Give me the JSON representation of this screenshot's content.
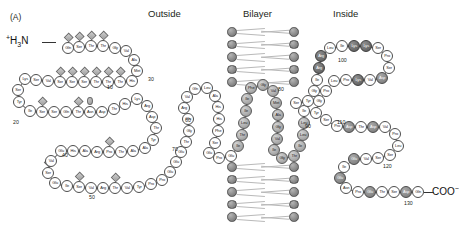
{
  "figure": {
    "panel_label": "(A)",
    "type": "membrane-protein-topology-diagram",
    "n_terminus": "H3N",
    "n_terminus_charge": "+",
    "c_terminus": "COO",
    "c_terminus_charge": "-"
  },
  "headers": [
    {
      "label": "Outside",
      "x": 148,
      "y": 8
    },
    {
      "label": "Bilayer",
      "x": 243,
      "y": 8
    },
    {
      "label": "Inside",
      "x": 333,
      "y": 8
    }
  ],
  "legend_markers": {
    "diamond": "o-linked-glycosylation-site",
    "oval": "n-linked-glycosylation-site",
    "light-circle": "extracellular-residue",
    "shaded-circle": "transmembrane-residue",
    "dark-circle": "charged-residue"
  },
  "number_labels": [
    {
      "text": "10",
      "x": 107,
      "y": 84
    },
    {
      "text": "20",
      "x": 13,
      "y": 119
    },
    {
      "text": "30",
      "x": 148,
      "y": 76
    },
    {
      "text": "40",
      "x": 62,
      "y": 152
    },
    {
      "text": "50",
      "x": 89,
      "y": 194
    },
    {
      "text": "60",
      "x": 185,
      "y": 117
    },
    {
      "text": "70",
      "x": 172,
      "y": 146
    },
    {
      "text": "80",
      "x": 278,
      "y": 86
    },
    {
      "text": "90",
      "x": 305,
      "y": 123
    },
    {
      "text": "100",
      "x": 338,
      "y": 57
    },
    {
      "text": "110",
      "x": 337,
      "y": 119
    },
    {
      "text": "120",
      "x": 383,
      "y": 163
    },
    {
      "text": "130",
      "x": 404,
      "y": 200
    }
  ],
  "residues": [
    {
      "n": 1,
      "aa": "Gln",
      "x": 62,
      "y": 42,
      "c": "p",
      "mark": "dia"
    },
    {
      "n": 2,
      "aa": "Ser",
      "x": 73,
      "y": 41,
      "c": "p",
      "mark": "dia"
    },
    {
      "n": 3,
      "aa": "Thr",
      "x": 85,
      "y": 40,
      "c": "p",
      "mark": "dia"
    },
    {
      "n": 4,
      "aa": "Thr",
      "x": 97,
      "y": 40,
      "c": "p",
      "mark": "dia"
    },
    {
      "n": 5,
      "aa": "Gly",
      "x": 109,
      "y": 42,
      "c": "p"
    },
    {
      "n": 6,
      "aa": "Val",
      "x": 120,
      "y": 45,
      "c": "p"
    },
    {
      "n": 7,
      "aa": "Ala",
      "x": 128,
      "y": 54,
      "c": "p"
    },
    {
      "n": 8,
      "aa": "Met",
      "x": 131,
      "y": 65,
      "c": "p"
    },
    {
      "n": 9,
      "aa": "His",
      "x": 126,
      "y": 75,
      "c": "p"
    },
    {
      "n": 10,
      "aa": "Thr",
      "x": 114,
      "y": 76,
      "c": "p",
      "mark": "dia"
    },
    {
      "n": 11,
      "aa": "Thr",
      "x": 102,
      "y": 76,
      "c": "p",
      "mark": "dia"
    },
    {
      "n": 12,
      "aa": "Thr",
      "x": 90,
      "y": 76,
      "c": "p",
      "mark": "dia"
    },
    {
      "n": 13,
      "aa": "Ser",
      "x": 78,
      "y": 76,
      "c": "p",
      "mark": "dia"
    },
    {
      "n": 14,
      "aa": "Ser",
      "x": 66,
      "y": 76,
      "c": "p",
      "mark": "dia"
    },
    {
      "n": 15,
      "aa": "Ser",
      "x": 54,
      "y": 76,
      "c": "p",
      "mark": "dia"
    },
    {
      "n": 16,
      "aa": "Val",
      "x": 42,
      "y": 75,
      "c": "p"
    },
    {
      "n": 17,
      "aa": "Ser",
      "x": 30,
      "y": 74,
      "c": "p"
    },
    {
      "n": 18,
      "aa": "Lys",
      "x": 19,
      "y": 73,
      "c": "p"
    },
    {
      "n": 19,
      "aa": "Ser",
      "x": 12,
      "y": 84,
      "c": "p"
    },
    {
      "n": 20,
      "aa": "Tyr",
      "x": 13,
      "y": 96,
      "c": "p"
    },
    {
      "n": 21,
      "aa": "Ile",
      "x": 24,
      "y": 105,
      "c": "p"
    },
    {
      "n": 22,
      "aa": "Ser",
      "x": 36,
      "y": 106,
      "c": "p",
      "mark": "dia"
    },
    {
      "n": 23,
      "aa": "Ser",
      "x": 48,
      "y": 106,
      "c": "p"
    },
    {
      "n": 24,
      "aa": "Gln",
      "x": 60,
      "y": 106,
      "c": "p"
    },
    {
      "n": 25,
      "aa": "Thr",
      "x": 72,
      "y": 106,
      "c": "p",
      "mark": "dia"
    },
    {
      "n": 26,
      "aa": "Asn",
      "x": 84,
      "y": 106,
      "c": "p",
      "mark": "ova"
    },
    {
      "n": 27,
      "aa": "Asp",
      "x": 96,
      "y": 106,
      "c": "p"
    },
    {
      "n": 28,
      "aa": "Thr",
      "x": 108,
      "y": 103,
      "c": "p"
    },
    {
      "n": 29,
      "aa": "His",
      "x": 119,
      "y": 98,
      "c": "p"
    },
    {
      "n": 30,
      "aa": "Lys",
      "x": 131,
      "y": 93,
      "c": "p"
    },
    {
      "n": 31,
      "aa": "Arg",
      "x": 141,
      "y": 100,
      "c": "p"
    },
    {
      "n": 32,
      "aa": "Asp",
      "x": 146,
      "y": 111,
      "c": "p"
    },
    {
      "n": 33,
      "aa": "Thr",
      "x": 150,
      "y": 122,
      "c": "p"
    },
    {
      "n": 34,
      "aa": "Tyr",
      "x": 147,
      "y": 134,
      "c": "p"
    },
    {
      "n": 35,
      "aa": "Ala",
      "x": 139,
      "y": 142,
      "c": "p"
    },
    {
      "n": 36,
      "aa": "Ala",
      "x": 127,
      "y": 145,
      "c": "p"
    },
    {
      "n": 37,
      "aa": "Thr",
      "x": 115,
      "y": 146,
      "c": "p"
    },
    {
      "n": 38,
      "aa": "Pro",
      "x": 103,
      "y": 146,
      "c": "p",
      "mark": "dia"
    },
    {
      "n": 39,
      "aa": "Arg",
      "x": 91,
      "y": 146,
      "c": "p"
    },
    {
      "n": 40,
      "aa": "Ala",
      "x": 79,
      "y": 145,
      "c": "p"
    },
    {
      "n": 41,
      "aa": "His",
      "x": 67,
      "y": 145,
      "c": "p"
    },
    {
      "n": 42,
      "aa": "Glu",
      "x": 55,
      "y": 145,
      "c": "p"
    },
    {
      "n": 43,
      "aa": "Val",
      "x": 45,
      "y": 155,
      "c": "p"
    },
    {
      "n": 44,
      "aa": "Ser",
      "x": 42,
      "y": 167,
      "c": "p",
      "mark": "dia"
    },
    {
      "n": 45,
      "aa": "Glu",
      "x": 49,
      "y": 177,
      "c": "p"
    },
    {
      "n": 46,
      "aa": "Ile",
      "x": 61,
      "y": 180,
      "c": "p"
    },
    {
      "n": 47,
      "aa": "Ser",
      "x": 73,
      "y": 181,
      "c": "p",
      "mark": "dia"
    },
    {
      "n": 48,
      "aa": "Val",
      "x": 85,
      "y": 182,
      "c": "p"
    },
    {
      "n": 49,
      "aa": "Arg",
      "x": 97,
      "y": 182,
      "c": "p"
    },
    {
      "n": 50,
      "aa": "Thr",
      "x": 109,
      "y": 182,
      "c": "p",
      "mark": "dia"
    },
    {
      "n": 51,
      "aa": "Val",
      "x": 121,
      "y": 182,
      "c": "p"
    },
    {
      "n": 52,
      "aa": "Tyr",
      "x": 133,
      "y": 181,
      "c": "p"
    },
    {
      "n": 53,
      "aa": "Pro",
      "x": 145,
      "y": 178,
      "c": "p"
    },
    {
      "n": 54,
      "aa": "Pro",
      "x": 156,
      "y": 174,
      "c": "p"
    },
    {
      "n": 55,
      "aa": "Glu",
      "x": 164,
      "y": 166,
      "c": "p"
    },
    {
      "n": 56,
      "aa": "Glu",
      "x": 170,
      "y": 156,
      "c": "p"
    },
    {
      "n": 57,
      "aa": "Glu",
      "x": 175,
      "y": 146,
      "c": "p"
    },
    {
      "n": 58,
      "aa": "Thr",
      "x": 180,
      "y": 136,
      "c": "p"
    },
    {
      "n": 59,
      "aa": "Gly",
      "x": 183,
      "y": 125,
      "c": "p"
    },
    {
      "n": 60,
      "aa": "Glu",
      "x": 182,
      "y": 113,
      "c": "p"
    },
    {
      "n": 61,
      "aa": "Arg",
      "x": 178,
      "y": 102,
      "c": "p"
    },
    {
      "n": 62,
      "aa": "Val",
      "x": 181,
      "y": 91,
      "c": "p"
    },
    {
      "n": 63,
      "aa": "Gln",
      "x": 189,
      "y": 83,
      "c": "p"
    },
    {
      "n": 64,
      "aa": "Leu",
      "x": 201,
      "y": 82,
      "c": "p"
    },
    {
      "n": 65,
      "aa": "Ala",
      "x": 209,
      "y": 90,
      "c": "p"
    },
    {
      "n": 66,
      "aa": "His",
      "x": 212,
      "y": 101,
      "c": "p"
    },
    {
      "n": 67,
      "aa": "His",
      "x": 213,
      "y": 113,
      "c": "p"
    },
    {
      "n": 68,
      "aa": "Phe",
      "x": 212,
      "y": 125,
      "c": "p"
    },
    {
      "n": 69,
      "aa": "Ser",
      "x": 209,
      "y": 137,
      "c": "p"
    },
    {
      "n": 70,
      "aa": "Glu",
      "x": 203,
      "y": 147,
      "c": "p"
    },
    {
      "n": 71,
      "aa": "Pro",
      "x": 213,
      "y": 152,
      "c": "p"
    },
    {
      "n": 72,
      "aa": "Glu",
      "x": 225,
      "y": 150,
      "c": "p"
    },
    {
      "n": 73,
      "aa": "Ile",
      "x": 232,
      "y": 140,
      "c": "tm"
    },
    {
      "n": 74,
      "aa": "Thr",
      "x": 236,
      "y": 129,
      "c": "tm"
    },
    {
      "n": 75,
      "aa": "Leu",
      "x": 238,
      "y": 117,
      "c": "tm"
    },
    {
      "n": 76,
      "aa": "Ile",
      "x": 240,
      "y": 105,
      "c": "tm"
    },
    {
      "n": 77,
      "aa": "Ile",
      "x": 241,
      "y": 93,
      "c": "tm"
    },
    {
      "n": 78,
      "aa": "Phe",
      "x": 245,
      "y": 82,
      "c": "tm"
    },
    {
      "n": 79,
      "aa": "Gly",
      "x": 257,
      "y": 79,
      "c": "tm"
    },
    {
      "n": 80,
      "aa": "Val",
      "x": 267,
      "y": 85,
      "c": "tm"
    },
    {
      "n": 81,
      "aa": "Met",
      "x": 270,
      "y": 97,
      "c": "tm"
    },
    {
      "n": 82,
      "aa": "Ala",
      "x": 272,
      "y": 109,
      "c": "tm"
    },
    {
      "n": 83,
      "aa": "Gly",
      "x": 272,
      "y": 121,
      "c": "tm"
    },
    {
      "n": 84,
      "aa": "Val",
      "x": 271,
      "y": 133,
      "c": "tm"
    },
    {
      "n": 85,
      "aa": "Ile",
      "x": 268,
      "y": 144,
      "c": "tm"
    },
    {
      "n": 86,
      "aa": "Gly",
      "x": 276,
      "y": 152,
      "c": "tm"
    },
    {
      "n": 87,
      "aa": "Thr",
      "x": 288,
      "y": 150,
      "c": "tm"
    },
    {
      "n": 88,
      "aa": "Ile",
      "x": 294,
      "y": 140,
      "c": "tm"
    },
    {
      "n": 89,
      "aa": "Leu",
      "x": 297,
      "y": 129,
      "c": "tm"
    },
    {
      "n": 90,
      "aa": "Leu",
      "x": 298,
      "y": 117,
      "c": "tm"
    },
    {
      "n": 91,
      "aa": "Ile",
      "x": 298,
      "y": 105,
      "c": "p"
    },
    {
      "n": 92,
      "aa": "Ser",
      "x": 290,
      "y": 97,
      "c": "p"
    },
    {
      "n": 93,
      "aa": "Tyr",
      "x": 302,
      "y": 95,
      "c": "p"
    },
    {
      "n": 94,
      "aa": "Gly",
      "x": 308,
      "y": 85,
      "c": "p"
    },
    {
      "n": 95,
      "aa": "Ile",
      "x": 311,
      "y": 74,
      "c": "p"
    },
    {
      "n": 96,
      "aa": "Arg",
      "x": 313,
      "y": 62,
      "c": "pos"
    },
    {
      "n": 97,
      "aa": "Arg",
      "x": 315,
      "y": 50,
      "c": "pos"
    },
    {
      "n": 98,
      "aa": "Leu",
      "x": 324,
      "y": 42,
      "c": "p"
    },
    {
      "n": 99,
      "aa": "Ile",
      "x": 336,
      "y": 40,
      "c": "p"
    },
    {
      "n": 100,
      "aa": "Lys",
      "x": 348,
      "y": 40,
      "c": "pos"
    },
    {
      "n": 101,
      "aa": "Lys",
      "x": 360,
      "y": 40,
      "c": "pos"
    },
    {
      "n": 102,
      "aa": "Ser",
      "x": 372,
      "y": 42,
      "c": "p"
    },
    {
      "n": 103,
      "aa": "Pro",
      "x": 381,
      "y": 50,
      "c": "p"
    },
    {
      "n": 104,
      "aa": "Ser",
      "x": 383,
      "y": 62,
      "c": "p"
    },
    {
      "n": 105,
      "aa": "Asp",
      "x": 376,
      "y": 72,
      "c": "neg"
    },
    {
      "n": 106,
      "aa": "Val",
      "x": 364,
      "y": 74,
      "c": "p"
    },
    {
      "n": 107,
      "aa": "Lys",
      "x": 352,
      "y": 74,
      "c": "pos"
    },
    {
      "n": 108,
      "aa": "Pro",
      "x": 340,
      "y": 74,
      "c": "p"
    },
    {
      "n": 109,
      "aa": "Leu",
      "x": 328,
      "y": 75,
      "c": "p"
    },
    {
      "n": 110,
      "aa": "Pro",
      "x": 320,
      "y": 85,
      "c": "p"
    },
    {
      "n": 111,
      "aa": "Gly",
      "x": 313,
      "y": 95,
      "c": "p"
    },
    {
      "n": 112,
      "aa": "Tyr",
      "x": 310,
      "y": 107,
      "c": "p"
    },
    {
      "n": 113,
      "aa": "Ser",
      "x": 320,
      "y": 114,
      "c": "p"
    },
    {
      "n": 114,
      "aa": "Pro",
      "x": 331,
      "y": 120,
      "c": "p"
    },
    {
      "n": 115,
      "aa": "Asp",
      "x": 343,
      "y": 121,
      "c": "neg"
    },
    {
      "n": 116,
      "aa": "Thr",
      "x": 355,
      "y": 121,
      "c": "p"
    },
    {
      "n": 117,
      "aa": "Asp",
      "x": 367,
      "y": 121,
      "c": "neg"
    },
    {
      "n": 118,
      "aa": "Val",
      "x": 379,
      "y": 121,
      "c": "p"
    },
    {
      "n": 119,
      "aa": "Pro",
      "x": 389,
      "y": 128,
      "c": "p"
    },
    {
      "n": 120,
      "aa": "Leu",
      "x": 392,
      "y": 140,
      "c": "p"
    },
    {
      "n": 121,
      "aa": "Ser",
      "x": 384,
      "y": 149,
      "c": "p"
    },
    {
      "n": 122,
      "aa": "Ser",
      "x": 372,
      "y": 152,
      "c": "p"
    },
    {
      "n": 123,
      "aa": "Val",
      "x": 360,
      "y": 153,
      "c": "p"
    },
    {
      "n": 124,
      "aa": "Glu",
      "x": 348,
      "y": 153,
      "c": "neg"
    },
    {
      "n": 125,
      "aa": "Ile",
      "x": 338,
      "y": 161,
      "c": "p"
    },
    {
      "n": 126,
      "aa": "Glu",
      "x": 334,
      "y": 172,
      "c": "neg"
    },
    {
      "n": 127,
      "aa": "Asn",
      "x": 340,
      "y": 182,
      "c": "p"
    },
    {
      "n": 128,
      "aa": "Pro",
      "x": 352,
      "y": 186,
      "c": "p"
    },
    {
      "n": 129,
      "aa": "Glu",
      "x": 364,
      "y": 186,
      "c": "neg"
    },
    {
      "n": 130,
      "aa": "Thr",
      "x": 376,
      "y": 186,
      "c": "p"
    },
    {
      "n": 131,
      "aa": "Ser",
      "x": 388,
      "y": 186,
      "c": "p"
    },
    {
      "n": 132,
      "aa": "Asp",
      "x": 400,
      "y": 186,
      "c": "neg"
    },
    {
      "n": 133,
      "aa": "Gln",
      "x": 412,
      "y": 186,
      "c": "p"
    }
  ],
  "bilayer": {
    "upper": {
      "x": 227,
      "y": 27,
      "rows": 5,
      "width": 72
    },
    "lower": {
      "x": 227,
      "y": 162,
      "rows": 5,
      "width": 72
    }
  }
}
